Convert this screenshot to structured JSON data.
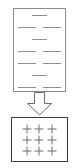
{
  "header": {
    "caption": "  ",
    "caption_visible": "illegible cut-off text strip"
  },
  "diagram": {
    "type": "process-flow",
    "title": "",
    "source_panel": {
      "name": "source-box",
      "border_color": "#8c8c8c",
      "background": "#ffffff",
      "content_type": "dash-rows",
      "rows": [
        {
          "layout": "single",
          "dashes": 1
        },
        {
          "layout": "pair",
          "dashes": 2
        },
        {
          "layout": "single",
          "dashes": 1
        },
        {
          "layout": "pair",
          "dashes": 2
        },
        {
          "layout": "pair",
          "dashes": 2
        },
        {
          "layout": "single",
          "dashes": 1
        },
        {
          "layout": "pair",
          "dashes": 2
        }
      ],
      "dash_color": "#8e8e8e"
    },
    "arrow": {
      "name": "down-arrow",
      "direction": "down",
      "style": "block-outline",
      "stroke_color": "#6a6a6a",
      "fill": "#ffffff"
    },
    "result_panel": {
      "name": "result-box",
      "border_color": "#3d3d3d",
      "background": "#ffffff",
      "content_type": "plus-grid",
      "grid_rows": 3,
      "grid_cols": 3,
      "marks": [
        [
          "+",
          "+",
          "+"
        ],
        [
          "+",
          "+",
          "+"
        ],
        [
          "+",
          "+",
          "+"
        ]
      ],
      "mark_color": "#6e6e6e"
    }
  }
}
